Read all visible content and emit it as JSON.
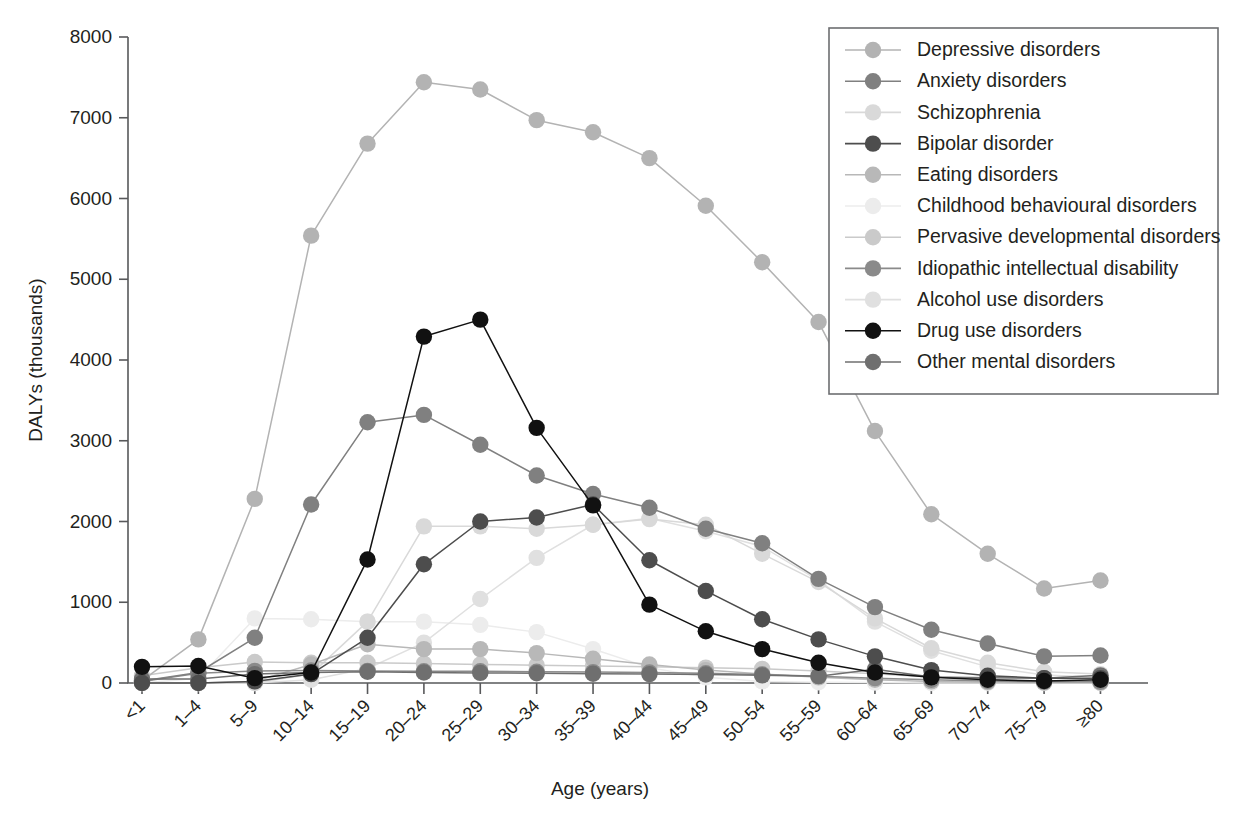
{
  "chart_data": {
    "type": "line",
    "title": "",
    "xlabel": "Age (years)",
    "ylabel": "DALYs (thousands)",
    "categories": [
      "<1",
      "1–4",
      "5–9",
      "10–14",
      "15–19",
      "20–24",
      "25–29",
      "30–34",
      "35–39",
      "40–44",
      "45–49",
      "50–54",
      "55–59",
      "60–64",
      "65–69",
      "70–74",
      "75–79",
      "≥80"
    ],
    "ylim": [
      0,
      8000
    ],
    "yticks": [
      0,
      1000,
      2000,
      3000,
      4000,
      5000,
      6000,
      7000,
      8000
    ],
    "ytick_labels": [
      "0",
      "1000",
      "2000",
      "3000",
      "4000",
      "5000",
      "6000",
      "7000",
      "8000"
    ],
    "grid": false,
    "legend_position": "top-right",
    "marker": "circle",
    "series": [
      {
        "name": "Depressive disorders",
        "color": "#b3b3b3",
        "values": [
          30,
          540,
          2280,
          5540,
          6680,
          7440,
          7350,
          6970,
          6820,
          6500,
          5910,
          5210,
          4470,
          3120,
          2090,
          1600,
          1170,
          1270
        ]
      },
      {
        "name": "Anxiety disorders",
        "color": "#808080",
        "values": [
          25,
          130,
          560,
          2210,
          3230,
          3320,
          2950,
          2570,
          2340,
          2170,
          1910,
          1730,
          1290,
          940,
          660,
          490,
          330,
          340
        ]
      },
      {
        "name": "Schizophrenia",
        "color": "#d9d9d9",
        "values": [
          0,
          0,
          0,
          110,
          760,
          1940,
          1940,
          1910,
          1960,
          2030,
          1960,
          1600,
          1250,
          800,
          430,
          250,
          140,
          110
        ]
      },
      {
        "name": "Bipolar disorder",
        "color": "#4d4d4d",
        "values": [
          0,
          0,
          20,
          110,
          560,
          1470,
          2000,
          2050,
          2210,
          1520,
          1140,
          790,
          540,
          330,
          160,
          90,
          60,
          60
        ]
      },
      {
        "name": "Eating disorders",
        "color": "#b8b8b8",
        "values": [
          0,
          0,
          20,
          230,
          480,
          420,
          420,
          370,
          300,
          230,
          160,
          110,
          70,
          40,
          20,
          10,
          5,
          5
        ]
      },
      {
        "name": "Childhood behavioural disorders",
        "color": "#ececec",
        "values": [
          0,
          60,
          800,
          790,
          760,
          760,
          720,
          630,
          420,
          190,
          70,
          20,
          10,
          5,
          0,
          0,
          0,
          0
        ]
      },
      {
        "name": "Pervasive developmental disorders",
        "color": "#cacaca",
        "values": [
          90,
          190,
          260,
          250,
          250,
          240,
          230,
          220,
          210,
          200,
          190,
          175,
          150,
          115,
          75,
          45,
          25,
          15
        ]
      },
      {
        "name": "Idiopathic intellectual disability",
        "color": "#8a8a8a",
        "values": [
          20,
          120,
          150,
          155,
          150,
          145,
          145,
          140,
          135,
          130,
          120,
          105,
          85,
          60,
          40,
          25,
          15,
          15
        ]
      },
      {
        "name": "Alcohol use disorders",
        "color": "#e0e0e0",
        "values": [
          0,
          0,
          0,
          40,
          180,
          500,
          1040,
          1550,
          1960,
          2040,
          1880,
          1690,
          1270,
          760,
          400,
          200,
          100,
          70
        ]
      },
      {
        "name": "Drug use disorders",
        "color": "#111111",
        "values": [
          200,
          210,
          60,
          130,
          1530,
          4290,
          4500,
          3160,
          2200,
          970,
          640,
          420,
          250,
          130,
          70,
          40,
          25,
          40
        ]
      },
      {
        "name": "Other mental disorders",
        "color": "#6f6f6f",
        "values": [
          50,
          50,
          110,
          130,
          140,
          130,
          125,
          120,
          115,
          110,
          105,
          95,
          85,
          170,
          75,
          65,
          60,
          95
        ]
      }
    ]
  },
  "legend": {
    "entries": [
      "Depressive disorders",
      "Anxiety disorders",
      "Schizophrenia",
      "Bipolar disorder",
      "Eating disorders",
      "Childhood behavioural disorders",
      "Pervasive developmental disorders",
      "Idiopathic intellectual disability",
      "Alcohol use disorders",
      "Drug use disorders",
      "Other mental disorders"
    ]
  },
  "colors": {
    "axis": "#58595b",
    "text": "#231f20",
    "legend_border": "#6d6e71",
    "background": "#ffffff"
  }
}
